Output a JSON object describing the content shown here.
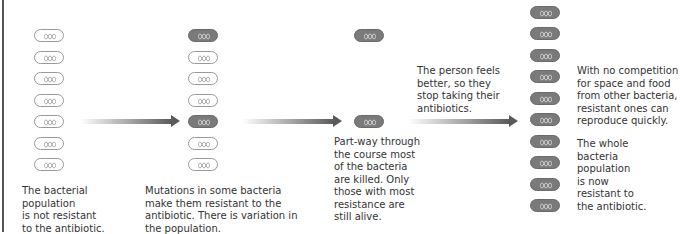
{
  "diagram": {
    "colors": {
      "normal_bacterium_outline": "#9a9a9a",
      "resistant_bacterium_fill": "#7a7a7a",
      "arrow": "#5a5a5a",
      "text": "#333333"
    },
    "stages": [
      {
        "id": "stage1",
        "bacteria": [
          "normal",
          "normal",
          "normal",
          "normal",
          "normal",
          "normal",
          "normal"
        ],
        "caption": "The bacterial\npopulation\nis not resistant\nto the antibiotic."
      },
      {
        "id": "stage2",
        "bacteria": [
          "resistant",
          "normal",
          "normal",
          "normal",
          "resistant",
          "normal",
          "normal"
        ],
        "caption": "Mutations in some bacteria\nmake them resistant to the\nantibiotic. There is variation in\nthe population."
      },
      {
        "id": "stage3",
        "bacteria": [
          "resistant",
          "resistant"
        ],
        "caption": "Part-way through\nthe course most\nof the bacteria\nare killed. Only\nthose with most\nresistance are\nstill alive."
      },
      {
        "id": "stage4",
        "bacteria": [
          "resistant",
          "resistant",
          "resistant",
          "resistant",
          "resistant",
          "resistant",
          "resistant",
          "resistant",
          "resistant",
          "resistant"
        ],
        "caption": "With no competition\nfor space and food\nfrom other bacteria,\nresistant ones can\nreproduce quickly.",
        "caption2": "The whole\nbacteria\npopulation\nis now\nresistant to\nthe antibiotic."
      }
    ],
    "arrow_labels": {
      "arrow3": "The person feels\nbetter, so they\nstop taking their\nantibiotics."
    }
  }
}
